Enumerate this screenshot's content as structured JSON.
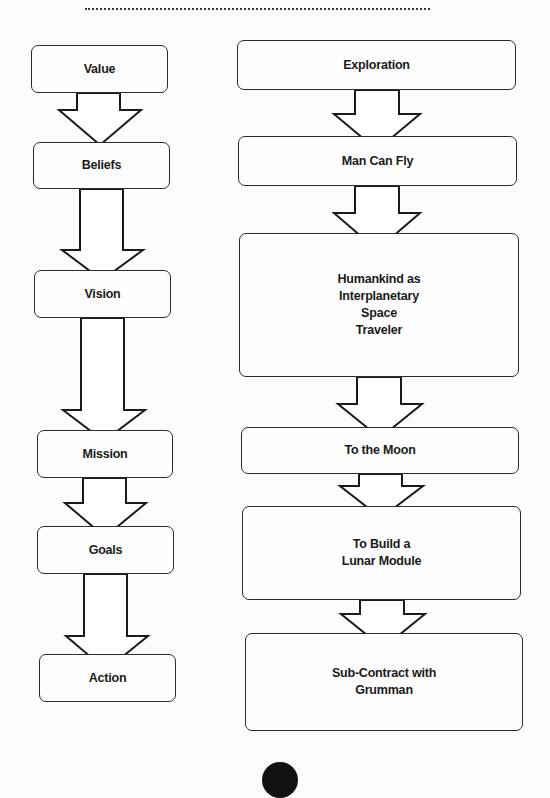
{
  "header": {
    "divider": "dotted-rule"
  },
  "left_chain": {
    "title": "Value to Action",
    "nodes": [
      {
        "label": "Value"
      },
      {
        "label": "Beliefs"
      },
      {
        "label": "Vision"
      },
      {
        "label": "Mission"
      },
      {
        "label": "Goals"
      },
      {
        "label": "Action"
      }
    ]
  },
  "right_chain": {
    "title": "Apollo example",
    "nodes": [
      {
        "label": "Exploration"
      },
      {
        "label": "Man Can Fly"
      },
      {
        "label": "Humankind as\nInterplanetary\nSpace\nTraveler"
      },
      {
        "label": "To the Moon"
      },
      {
        "label": "To Build a\nLunar Module"
      },
      {
        "label": "Sub-Contract with\nGrumman"
      }
    ]
  },
  "connector": {
    "type": "block-arrow-down",
    "stroke": "#1a1a1a",
    "fill": "#ffffff"
  },
  "footer": {
    "page_marker": "black-circle"
  }
}
